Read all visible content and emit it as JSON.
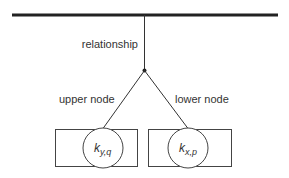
{
  "diagram": {
    "labels": {
      "relationship": "relationship",
      "upper_node": "upper node",
      "lower_node": "lower node"
    },
    "nodes": [
      {
        "id": "upper",
        "symbol": "k",
        "subscript": "y,q"
      },
      {
        "id": "lower",
        "symbol": "k",
        "subscript": "x,p"
      }
    ],
    "colors": {
      "stroke": "#333333",
      "bar": "#222222",
      "background": "#ffffff"
    }
  }
}
